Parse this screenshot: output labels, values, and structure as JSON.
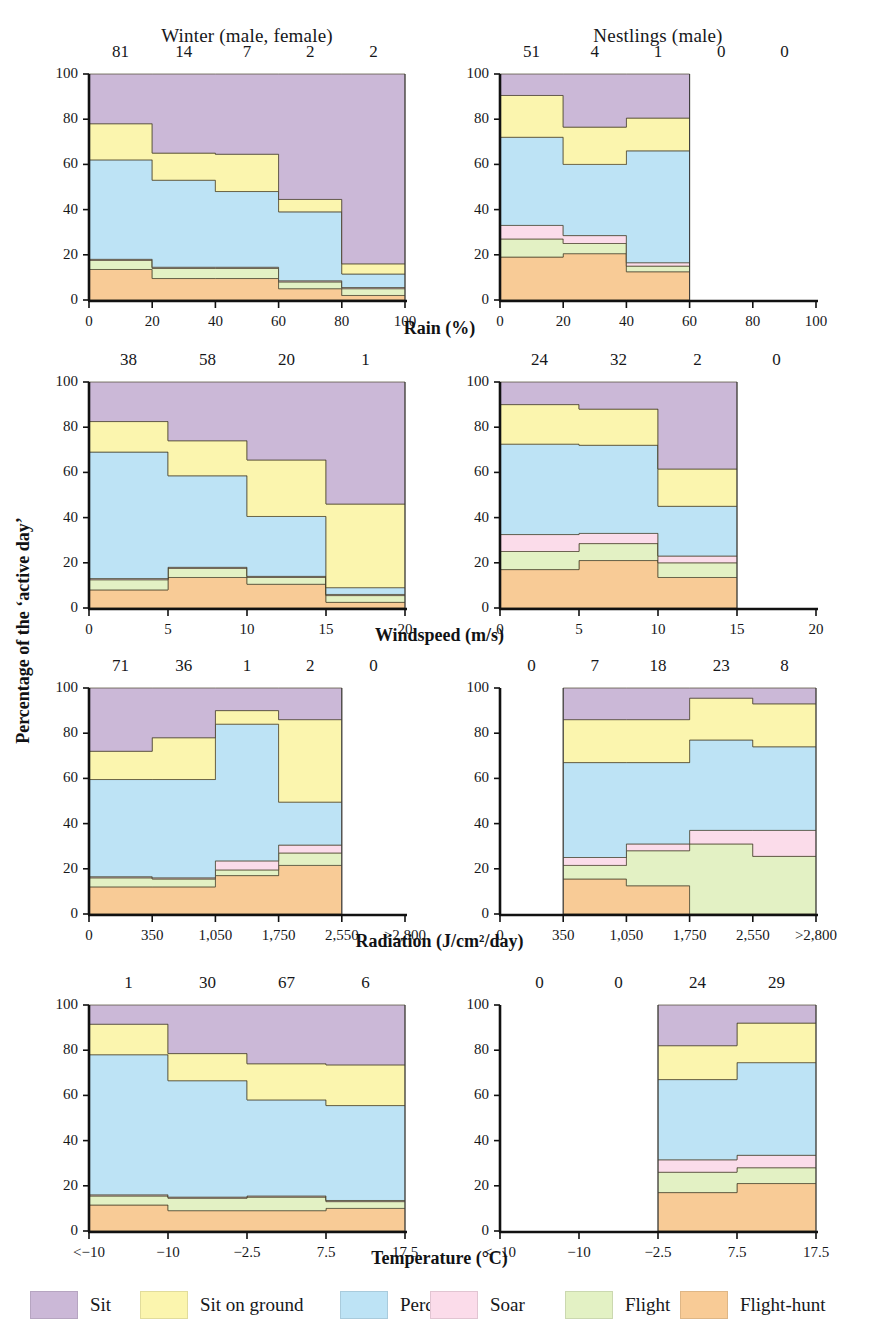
{
  "figure": {
    "y_axis_title": "Percentage of the ‘active day’",
    "column_titles": [
      "Winter (male, female)",
      "Nestlings (male)"
    ],
    "row_axis_titles": [
      "Rain (%)",
      "Windspeed (m/s)",
      "Radiation (J/cm²/day)",
      "Temperature (°C)"
    ],
    "y_ticks": [
      "0",
      "20",
      "40",
      "60",
      "80",
      "100"
    ]
  },
  "legend": {
    "items": [
      {
        "label": "Sit",
        "color": "#cbb8d7"
      },
      {
        "label": "Sit on ground",
        "color": "#fbf5ae"
      },
      {
        "label": "Perch",
        "color": "#bde3f5"
      },
      {
        "label": "Soar",
        "color": "#fbdcea"
      },
      {
        "label": "Flight",
        "color": "#e3f1c4"
      },
      {
        "label": "Flight-hunt",
        "color": "#f8cb96"
      }
    ]
  },
  "chart_data": [
    {
      "id": "rain-winter",
      "type": "area",
      "title": "Winter (male, female)",
      "xlabel": "Rain (%)",
      "ylabel": "Percentage of the ‘active day’",
      "xlim": [
        0,
        100
      ],
      "ylim": [
        0,
        100
      ],
      "x_ticks": [
        "0",
        "20",
        "40",
        "60",
        "80",
        "100"
      ],
      "x_tick_values": [
        0,
        20,
        40,
        60,
        80,
        100
      ],
      "bin_edges": [
        0,
        20,
        40,
        60,
        80,
        100
      ],
      "sample_counts": [
        "81",
        "14",
        "7",
        "2",
        "2"
      ],
      "series": [
        {
          "name": "Flight-hunt",
          "color": "#f8cb96",
          "values": [
            13.5,
            9.5,
            9.5,
            5.0,
            2.0
          ]
        },
        {
          "name": "Flight",
          "color": "#e3f1c4",
          "values": [
            4.0,
            4.5,
            4.5,
            3.0,
            3.0
          ]
        },
        {
          "name": "Soar",
          "color": "#fbdcea",
          "values": [
            0.5,
            0.5,
            0.5,
            0.5,
            0.5
          ]
        },
        {
          "name": "Perch",
          "color": "#bde3f5",
          "values": [
            44.0,
            38.5,
            33.5,
            30.5,
            6.0
          ]
        },
        {
          "name": "Sit on ground",
          "color": "#fbf5ae",
          "values": [
            16.0,
            12.0,
            16.5,
            5.5,
            4.5
          ]
        },
        {
          "name": "Sit",
          "color": "#cbb8d7",
          "values": [
            22.0,
            35.0,
            35.5,
            55.5,
            84.0
          ]
        }
      ]
    },
    {
      "id": "rain-nestlings",
      "type": "area",
      "title": "Nestlings (male)",
      "xlabel": "Rain (%)",
      "ylabel": "Percentage of the ‘active day’",
      "xlim": [
        0,
        100
      ],
      "ylim": [
        0,
        100
      ],
      "x_ticks": [
        "0",
        "20",
        "40",
        "60",
        "80",
        "100"
      ],
      "x_tick_values": [
        0,
        20,
        40,
        60,
        80,
        100
      ],
      "bin_edges": [
        0,
        20,
        40,
        60
      ],
      "sample_counts": [
        "51",
        "4",
        "1",
        "0",
        "0"
      ],
      "series": [
        {
          "name": "Flight-hunt",
          "color": "#f8cb96",
          "values": [
            19.0,
            20.5,
            12.5
          ]
        },
        {
          "name": "Flight",
          "color": "#e3f1c4",
          "values": [
            8.0,
            4.5,
            2.5
          ]
        },
        {
          "name": "Soar",
          "color": "#fbdcea",
          "values": [
            6.0,
            3.5,
            1.5
          ]
        },
        {
          "name": "Perch",
          "color": "#bde3f5",
          "values": [
            39.0,
            31.5,
            49.5
          ]
        },
        {
          "name": "Sit on ground",
          "color": "#fbf5ae",
          "values": [
            18.5,
            16.5,
            14.5
          ]
        },
        {
          "name": "Sit",
          "color": "#cbb8d7",
          "values": [
            9.5,
            23.5,
            19.5
          ]
        }
      ]
    },
    {
      "id": "windspeed-winter",
      "type": "area",
      "title": "Winter (male, female)",
      "xlabel": "Windspeed (m/s)",
      "ylabel": "Percentage of the ‘active day’",
      "xlim": [
        0,
        20
      ],
      "ylim": [
        0,
        100
      ],
      "x_ticks": [
        "0",
        "5",
        "10",
        "15",
        "20"
      ],
      "x_tick_values": [
        0,
        5,
        10,
        15,
        20
      ],
      "bin_edges": [
        0,
        5,
        10,
        15,
        20
      ],
      "sample_counts": [
        "38",
        "58",
        "20",
        "1"
      ],
      "series": [
        {
          "name": "Flight-hunt",
          "color": "#f8cb96",
          "values": [
            8.0,
            13.5,
            10.5,
            2.5
          ]
        },
        {
          "name": "Flight",
          "color": "#e3f1c4",
          "values": [
            4.5,
            4.0,
            3.0,
            3.0
          ]
        },
        {
          "name": "Soar",
          "color": "#fbdcea",
          "values": [
            0.5,
            0.5,
            0.5,
            0.5
          ]
        },
        {
          "name": "Perch",
          "color": "#bde3f5",
          "values": [
            56.0,
            40.5,
            26.5,
            3.0
          ]
        },
        {
          "name": "Sit on ground",
          "color": "#fbf5ae",
          "values": [
            13.5,
            15.5,
            25.0,
            37.0
          ]
        },
        {
          "name": "Sit",
          "color": "#cbb8d7",
          "values": [
            17.5,
            26.0,
            34.5,
            54.0
          ]
        }
      ]
    },
    {
      "id": "windspeed-nestlings",
      "type": "area",
      "title": "Nestlings (male)",
      "xlabel": "Windspeed (m/s)",
      "ylabel": "Percentage of the ‘active day’",
      "xlim": [
        0,
        20
      ],
      "ylim": [
        0,
        100
      ],
      "x_ticks": [
        "0",
        "5",
        "10",
        "15",
        "20"
      ],
      "x_tick_values": [
        0,
        5,
        10,
        15,
        20
      ],
      "bin_edges": [
        0,
        5,
        10,
        15
      ],
      "sample_counts": [
        "24",
        "32",
        "2",
        "0"
      ],
      "series": [
        {
          "name": "Flight-hunt",
          "color": "#f8cb96",
          "values": [
            17.0,
            21.0,
            13.5
          ]
        },
        {
          "name": "Flight",
          "color": "#e3f1c4",
          "values": [
            8.0,
            7.5,
            6.5
          ]
        },
        {
          "name": "Soar",
          "color": "#fbdcea",
          "values": [
            7.5,
            4.5,
            3.0
          ]
        },
        {
          "name": "Perch",
          "color": "#bde3f5",
          "values": [
            40.0,
            39.0,
            22.0
          ]
        },
        {
          "name": "Sit on ground",
          "color": "#fbf5ae",
          "values": [
            17.5,
            16.0,
            16.5
          ]
        },
        {
          "name": "Sit",
          "color": "#cbb8d7",
          "values": [
            10.0,
            12.0,
            38.5
          ]
        }
      ]
    },
    {
      "id": "radiation-winter",
      "type": "area",
      "title": "Winter (male, female)",
      "xlabel": "Radiation (J/cm²/day)",
      "ylabel": "Percentage of the ‘active day’",
      "xlim": [
        0,
        3500
      ],
      "ylim": [
        0,
        100
      ],
      "x_ticks": [
        "0",
        "350",
        "1,050",
        "1,750",
        "2,550",
        ">2,800"
      ],
      "x_tick_values": [
        0,
        700,
        1400,
        2100,
        2800,
        3500
      ],
      "bin_edges": [
        0,
        700,
        1400,
        2100,
        2800
      ],
      "sample_counts": [
        "71",
        "36",
        "1",
        "2",
        "0"
      ],
      "series": [
        {
          "name": "Flight-hunt",
          "color": "#f8cb96",
          "values": [
            12.0,
            12.0,
            17.0,
            21.5
          ]
        },
        {
          "name": "Flight",
          "color": "#e3f1c4",
          "values": [
            4.0,
            3.5,
            2.5,
            5.5
          ]
        },
        {
          "name": "Soar",
          "color": "#fbdcea",
          "values": [
            0.5,
            0.5,
            4.0,
            3.5
          ]
        },
        {
          "name": "Perch",
          "color": "#bde3f5",
          "values": [
            43.0,
            43.5,
            60.5,
            19.0
          ]
        },
        {
          "name": "Sit on ground",
          "color": "#fbf5ae",
          "values": [
            12.5,
            18.5,
            6.0,
            36.5
          ]
        },
        {
          "name": "Sit",
          "color": "#cbb8d7",
          "values": [
            28.0,
            22.0,
            10.0,
            14.0
          ]
        }
      ]
    },
    {
      "id": "radiation-nestlings",
      "type": "area",
      "title": "Nestlings (male)",
      "xlabel": "Radiation (J/cm²/day)",
      "ylabel": "Percentage of the ‘active day’",
      "xlim": [
        0,
        3500
      ],
      "ylim": [
        0,
        100
      ],
      "x_ticks": [
        "0",
        "350",
        "1,050",
        "1,750",
        "2,550",
        ">2,800"
      ],
      "x_tick_values": [
        0,
        700,
        1400,
        2100,
        2800,
        3500
      ],
      "bin_edges": [
        700,
        1400,
        2100,
        2800,
        3500
      ],
      "sample_counts": [
        "0",
        "7",
        "18",
        "23",
        "8"
      ],
      "series": [
        {
          "name": "Flight-hunt",
          "color": "#f8cb96",
          "values": [
            15.5,
            12.5,
            0.0,
            0.0
          ]
        },
        {
          "name": "Flight",
          "color": "#e3f1c4",
          "values": [
            6.0,
            15.5,
            31.0,
            25.5
          ]
        },
        {
          "name": "Soar",
          "color": "#fbdcea",
          "values": [
            3.5,
            3.0,
            6.0,
            11.5
          ]
        },
        {
          "name": "Perch",
          "color": "#bde3f5",
          "values": [
            42.0,
            36.0,
            40.0,
            37.0
          ]
        },
        {
          "name": "Sit on ground",
          "color": "#fbf5ae",
          "values": [
            19.0,
            19.0,
            18.5,
            19.0
          ]
        },
        {
          "name": "Sit",
          "color": "#cbb8d7",
          "values": [
            14.0,
            14.0,
            4.5,
            7.0
          ]
        }
      ]
    },
    {
      "id": "temperature-winter",
      "type": "area",
      "title": "Winter (male, female)",
      "xlabel": "Temperature (°C)",
      "ylabel": "Percentage of the ‘active day’",
      "xlim": [
        0,
        4
      ],
      "ylim": [
        0,
        100
      ],
      "x_ticks": [
        "<−10",
        "−10",
        "−2.5",
        "7.5",
        "17.5"
      ],
      "x_tick_values": [
        0,
        1,
        2,
        3,
        4
      ],
      "bin_edges": [
        0,
        1,
        2,
        3,
        4
      ],
      "sample_counts": [
        "1",
        "30",
        "67",
        "6"
      ],
      "series": [
        {
          "name": "Flight-hunt",
          "color": "#f8cb96",
          "values": [
            11.5,
            9.0,
            9.0,
            10.0
          ]
        },
        {
          "name": "Flight",
          "color": "#e3f1c4",
          "values": [
            4.0,
            5.5,
            6.0,
            3.0
          ]
        },
        {
          "name": "Soar",
          "color": "#fbdcea",
          "values": [
            0.5,
            0.5,
            0.5,
            0.5
          ]
        },
        {
          "name": "Perch",
          "color": "#bde3f5",
          "values": [
            62.0,
            51.5,
            42.5,
            42.0
          ]
        },
        {
          "name": "Sit on ground",
          "color": "#fbf5ae",
          "values": [
            13.5,
            12.0,
            16.0,
            18.0
          ]
        },
        {
          "name": "Sit",
          "color": "#cbb8d7",
          "values": [
            8.5,
            21.5,
            26.0,
            26.5
          ]
        }
      ]
    },
    {
      "id": "temperature-nestlings",
      "type": "area",
      "title": "Nestlings (male)",
      "xlabel": "Temperature (°C)",
      "ylabel": "Percentage of the ‘active day’",
      "xlim": [
        0,
        4
      ],
      "ylim": [
        0,
        100
      ],
      "x_ticks": [
        "<−10",
        "−10",
        "−2.5",
        "7.5",
        "17.5"
      ],
      "x_tick_values": [
        0,
        1,
        2,
        3,
        4
      ],
      "bin_edges": [
        2,
        3,
        4
      ],
      "sample_counts": [
        "0",
        "0",
        "24",
        "29"
      ],
      "series": [
        {
          "name": "Flight-hunt",
          "color": "#f8cb96",
          "values": [
            17.0,
            21.0
          ]
        },
        {
          "name": "Flight",
          "color": "#e3f1c4",
          "values": [
            9.0,
            7.0
          ]
        },
        {
          "name": "Soar",
          "color": "#fbdcea",
          "values": [
            5.5,
            5.5
          ]
        },
        {
          "name": "Perch",
          "color": "#bde3f5",
          "values": [
            35.5,
            41.0
          ]
        },
        {
          "name": "Sit on ground",
          "color": "#fbf5ae",
          "values": [
            15.0,
            17.5
          ]
        },
        {
          "name": "Sit",
          "color": "#cbb8d7",
          "values": [
            18.0,
            8.0
          ]
        }
      ]
    }
  ]
}
